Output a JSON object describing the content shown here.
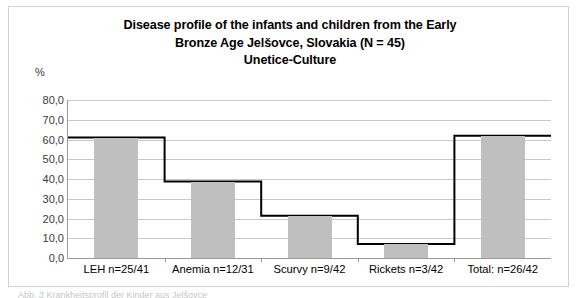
{
  "chart_data": {
    "type": "bar",
    "title": "Disease profile of the infants and children from the Early Bronze Age Jelšovce, Slovakia (N = 45) Unetice-Culture",
    "title_lines": [
      "Disease profile of the infants and children from the Early",
      "Bronze Age Jelšovce, Slovakia (N = 45)",
      "Unetice-Culture"
    ],
    "xlabel": "",
    "ylabel": "%",
    "ylim": [
      0,
      80
    ],
    "ytick_labels": [
      "80,0",
      "70,0",
      "60,0",
      "50,0",
      "40,0",
      "30,0",
      "20,0",
      "10,0",
      "0,0"
    ],
    "ytick_values": [
      80,
      70,
      60,
      50,
      40,
      30,
      20,
      10,
      0
    ],
    "grid": true,
    "legend": "none",
    "categories": [
      "LEH n=25/41",
      "Anemia n=12/31",
      "Scurvy n=9/42",
      "Rickets n=3/42",
      "Total: n=26/42"
    ],
    "series": [
      {
        "name": "prevalence-bars",
        "type": "bar",
        "color": "#BFBFBF",
        "values": [
          61.0,
          38.7,
          21.4,
          7.1,
          61.9
        ]
      },
      {
        "name": "prevalence-step-line",
        "type": "step",
        "color": "#000000",
        "values": [
          61.0,
          38.7,
          21.4,
          7.1,
          61.9
        ]
      }
    ],
    "counts": [
      {
        "category": "LEH",
        "affected": 25,
        "total": 41
      },
      {
        "category": "Anemia",
        "affected": 12,
        "total": 31
      },
      {
        "category": "Scurvy",
        "affected": 9,
        "total": 42
      },
      {
        "category": "Rickets",
        "affected": 3,
        "total": 42
      },
      {
        "category": "Total",
        "affected": 26,
        "total": 42
      }
    ],
    "colors": {
      "bar_fill": "#BFBFBF",
      "line": "#000000",
      "gridline": "#C9C9C9",
      "axis": "#9A9A9A",
      "border": "#D2D2D2",
      "text": "#000000"
    }
  },
  "caption_sliver": "Abb. 3  Krankheitsprofil der Kinder aus Jelšovce"
}
